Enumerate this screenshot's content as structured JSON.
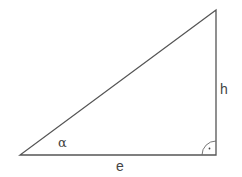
{
  "diagram": {
    "type": "right-triangle",
    "colors": {
      "stroke": "#555555",
      "text": "#444444",
      "background": "#ffffff"
    },
    "vertices": {
      "bottom_left": [
        20,
        155
      ],
      "bottom_right": [
        216,
        155
      ],
      "top_right": [
        216,
        10
      ]
    },
    "labels": {
      "angle": "α",
      "base": "e",
      "height": "h"
    },
    "right_angle_marker": {
      "at": "bottom_right",
      "symbol": "·"
    }
  }
}
